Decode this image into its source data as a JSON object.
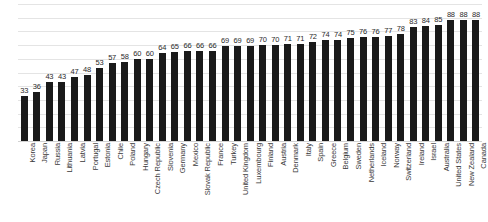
{
  "chart_data": {
    "type": "bar",
    "title": "",
    "subtitle": "",
    "xlabel": "",
    "ylabel": "",
    "ylim": [
      0,
      100
    ],
    "grid": true,
    "gridline_values": [
      0,
      10,
      20,
      30,
      40,
      50,
      60,
      70,
      80,
      90,
      100
    ],
    "legend": null,
    "legend_position": "none",
    "axis_tick_labels": [],
    "data_labels_shown": true,
    "bar_color": "#1a1a1a",
    "categories": [
      "Korea",
      "Japan",
      "Russia",
      "Lithuania",
      "Latvia",
      "Portugal",
      "Estonia",
      "Chile",
      "Poland",
      "Hungary",
      "Czech Republic",
      "Slovenia",
      "Germany",
      "Mexico",
      "Slovak Republic",
      "France",
      "Turkey",
      "United Kingdom",
      "Luxembourg",
      "Finland",
      "Austria",
      "Denmark",
      "Italy",
      "Spain",
      "Greece",
      "Belgium",
      "Sweden",
      "Netherlands",
      "Iceland",
      "Norway",
      "Switzerland",
      "Ireland",
      "Israel",
      "Australia",
      "United States",
      "New Zealand",
      "Canada"
    ],
    "values": [
      33,
      36,
      43,
      43,
      47,
      48,
      53,
      57,
      58,
      60,
      60,
      64,
      65,
      66,
      66,
      66,
      69,
      69,
      69,
      70,
      70,
      71,
      71,
      72,
      74,
      74,
      75,
      76,
      76,
      77,
      78,
      83,
      84,
      85,
      88,
      88,
      88
    ]
  }
}
